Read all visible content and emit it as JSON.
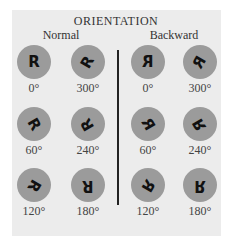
{
  "title": "ORIENTATION",
  "columns": {
    "normal": {
      "label": "Normal",
      "items": [
        {
          "glyph": "R",
          "angle": "0°",
          "rotate": 0,
          "mirror": false
        },
        {
          "glyph": "R",
          "angle": "300°",
          "rotate": -60,
          "mirror": false
        },
        {
          "glyph": "R",
          "angle": "60°",
          "rotate": 60,
          "mirror": false
        },
        {
          "glyph": "R",
          "angle": "240°",
          "rotate": -120,
          "mirror": false
        },
        {
          "glyph": "R",
          "angle": "120°",
          "rotate": 120,
          "mirror": false
        },
        {
          "glyph": "R",
          "angle": "180°",
          "rotate": 180,
          "mirror": false
        }
      ]
    },
    "backward": {
      "label": "Backward",
      "items": [
        {
          "glyph": "R",
          "angle": "0°",
          "rotate": 0,
          "mirror": true
        },
        {
          "glyph": "R",
          "angle": "300°",
          "rotate": -60,
          "mirror": true
        },
        {
          "glyph": "R",
          "angle": "60°",
          "rotate": 60,
          "mirror": true
        },
        {
          "glyph": "R",
          "angle": "240°",
          "rotate": -120,
          "mirror": true
        },
        {
          "glyph": "R",
          "angle": "120°",
          "rotate": 120,
          "mirror": true
        },
        {
          "glyph": "R",
          "angle": "180°",
          "rotate": 180,
          "mirror": true
        }
      ]
    }
  },
  "colors": {
    "panel": "#ececec",
    "disc": "#9b9b9b",
    "glyph": "#111111",
    "divider": "#222222"
  }
}
